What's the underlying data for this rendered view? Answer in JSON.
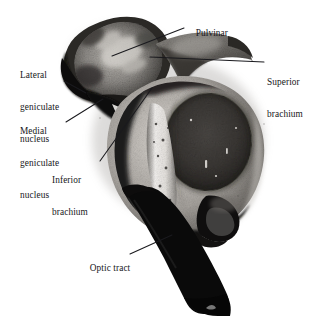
{
  "figure": {
    "type": "anatomical-photomicrograph",
    "background_color": "#ffffff",
    "text_color": "#16161a",
    "leader_color": "#1a1a1e",
    "width": 331,
    "height": 334
  },
  "labels": [
    {
      "id": "pulvinar",
      "text": "Pulvinar",
      "lines": [
        "Pulvinar"
      ],
      "x": 186,
      "y": 17,
      "align": "left",
      "leader": [
        [
          184,
          28
        ],
        [
          112,
          56
        ]
      ]
    },
    {
      "id": "lateral-geniculate-nucleus",
      "text": "Lateral geniculate nucleus",
      "lines": [
        "Lateral",
        "geniculate",
        "nucleus"
      ],
      "x": 20,
      "y": 49,
      "align": "left",
      "leader": [
        [
          64,
          81
        ],
        [
          86,
          93
        ]
      ]
    },
    {
      "id": "medial-geniculate-nucleus",
      "text": "Medial geniculate nucleus",
      "lines": [
        "Medial",
        "geniculate",
        "nucleus"
      ],
      "x": 20,
      "y": 105,
      "align": "left",
      "leader": [
        [
          66,
          122
        ],
        [
          103,
          99
        ]
      ]
    },
    {
      "id": "superior-brachium",
      "text": "Superior brachium",
      "lines": [
        "Superior",
        "brachium"
      ],
      "x": 267,
      "y": 56,
      "align": "left",
      "leader": [
        [
          264,
          62
        ],
        [
          150,
          57
        ]
      ]
    },
    {
      "id": "inferior-brachium",
      "text": "Inferior brachium",
      "lines": [
        "Inferior",
        "brachium"
      ],
      "x": 52,
      "y": 154,
      "align": "left",
      "leader": [
        [
          100,
          161
        ],
        [
          152,
          88
        ]
      ]
    },
    {
      "id": "optic-tract",
      "text": "Optic tract",
      "lines": [
        "Optic tract"
      ],
      "x": 80,
      "y": 252,
      "align": "left",
      "leader": [
        [
          130,
          254
        ],
        [
          172,
          235
        ]
      ]
    }
  ],
  "structures": [
    {
      "id": "pulvinar-lobe",
      "label": "Pulvinar",
      "tone": "mottled-mid-gray-with-dark-rim"
    },
    {
      "id": "lateral-geniculate-body",
      "label": "Lateral geniculate nucleus",
      "tone": "very-dark"
    },
    {
      "id": "medial-geniculate-body",
      "label": "Medial geniculate nucleus",
      "tone": "very-dark"
    },
    {
      "id": "superior-brachium-wing",
      "label": "Superior brachium",
      "tone": "mid-gray-hook"
    },
    {
      "id": "superior-colliculus-oval",
      "label": "dark central oval",
      "tone": "dark-granular"
    },
    {
      "id": "bright-band",
      "label": "pale vertical band",
      "tone": "near-white"
    },
    {
      "id": "optic-tract-band",
      "label": "Optic tract",
      "tone": "solid-black"
    },
    {
      "id": "inferior-tail",
      "label": "inferior protrusion",
      "tone": "black"
    }
  ]
}
